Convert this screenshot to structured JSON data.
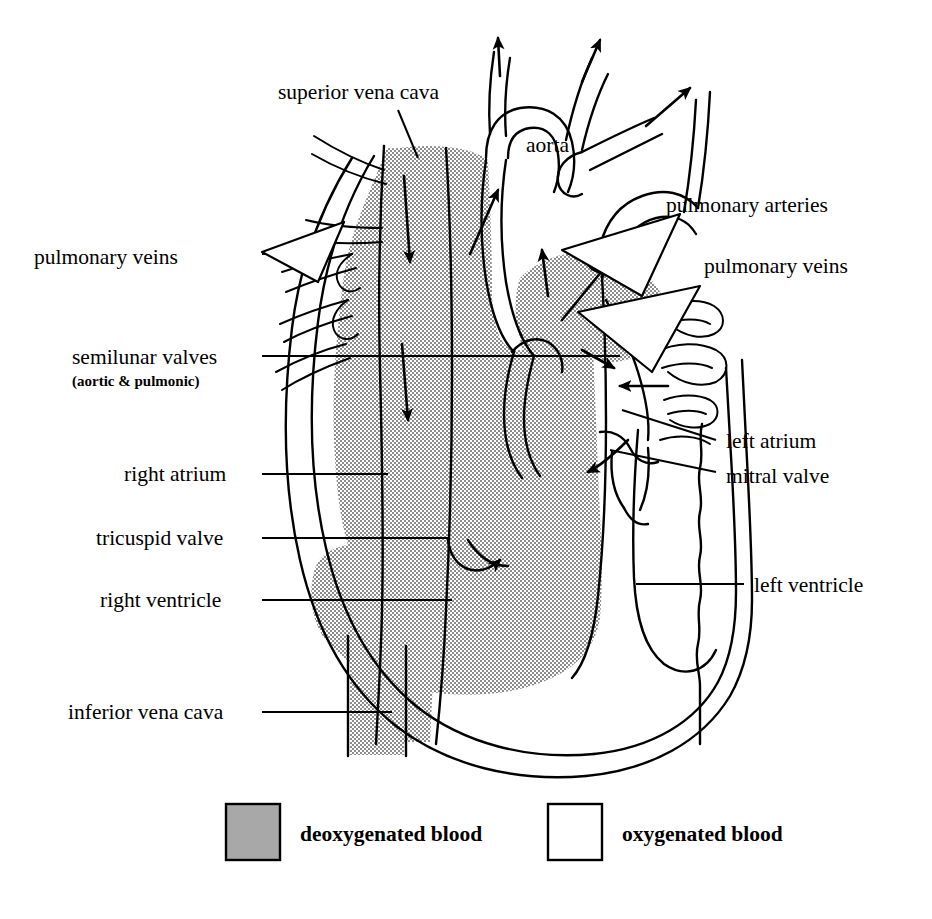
{
  "figure": {
    "colors": {
      "deoxygenated_fill": "#a8a8a8",
      "oxygenated_fill": "#ffffff",
      "line": "#000000",
      "background": "#ffffff"
    }
  },
  "labels": {
    "superior_vena_cava": "superior vena cava",
    "aorta": "aorta",
    "pulmonary_veins_left": "pulmonary veins",
    "pulmonary_arteries": "pulmonary arteries",
    "pulmonary_veins_right": "pulmonary veins",
    "semilunar_valves": "semilunar valves",
    "semilunar_valves_sub": "(aortic & pulmonic)",
    "right_atrium": "right atrium",
    "tricuspid_valve": "tricuspid valve",
    "right_ventricle": "right ventricle",
    "inferior_vena_cava": "inferior vena cava",
    "left_atrium": "left atrium",
    "mitral_valve": "mitral valve",
    "left_ventricle": "left ventricle"
  },
  "legend": {
    "items": [
      {
        "label": "deoxygenated blood",
        "swatch": "#a8a8a8",
        "type": "filled"
      },
      {
        "label": "oxygenated blood",
        "swatch": "#ffffff",
        "type": "outline"
      }
    ]
  },
  "flow_arrows": [
    {
      "name": "svc-inflow-down",
      "region": "superior vena cava",
      "direction": "down"
    },
    {
      "name": "right-atrium-down",
      "region": "right atrium",
      "direction": "down"
    },
    {
      "name": "tricuspid-up",
      "region": "tricuspid valve",
      "direction": "up-curved"
    },
    {
      "name": "pulmonary-outflow-up",
      "region": "pulmonary artery",
      "direction": "up"
    },
    {
      "name": "pulmonary-outflow-up-2",
      "region": "pulmonary artery",
      "direction": "up-right"
    },
    {
      "name": "aorta-up",
      "region": "aorta",
      "direction": "up-right"
    },
    {
      "name": "aorta-branch-1",
      "region": "aortic arch branch",
      "direction": "up"
    },
    {
      "name": "aorta-branch-2",
      "region": "aortic arch branch",
      "direction": "up"
    },
    {
      "name": "aorta-branch-3",
      "region": "aortic arch branch",
      "direction": "up-right"
    },
    {
      "name": "pulmonary-vein-inflow-1",
      "region": "left atrium",
      "direction": "left-down"
    },
    {
      "name": "pulmonary-vein-inflow-2",
      "region": "left atrium",
      "direction": "left"
    },
    {
      "name": "left-atrium-inflow",
      "region": "left atrium",
      "direction": "right"
    },
    {
      "name": "mitral-inflow",
      "region": "left ventricle",
      "direction": "left-down"
    }
  ]
}
